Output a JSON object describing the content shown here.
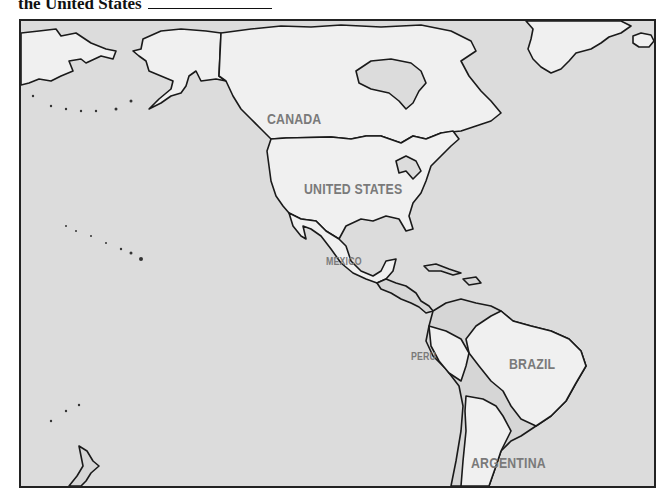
{
  "prompt": {
    "text": "the United States",
    "blank": ""
  },
  "map": {
    "colors": {
      "ocean": "#dcdcdc",
      "land_highlight": "#f0f0f0",
      "land_other": "#d6d6d6",
      "border": "#1a1a1a",
      "label": "#7a7a7a"
    },
    "labels": {
      "canada": "CANADA",
      "united_states": "UNITED STATES",
      "mexico": "MEXICO",
      "peru": "PERU",
      "brazil": "BRAZIL",
      "argentina": "ARGENTINA"
    }
  }
}
